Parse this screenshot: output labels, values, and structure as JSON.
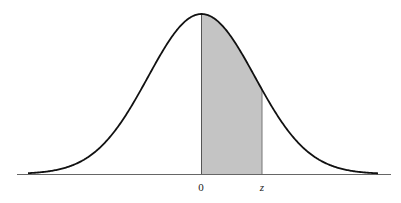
{
  "figure": {
    "type": "normal-distribution-curve",
    "shaded_region": {
      "from_label": "0",
      "to_label": "z"
    },
    "labels": {
      "origin": "0",
      "z": "z"
    },
    "colors": {
      "curve": "#111111",
      "shade": "#c4c4c4",
      "axis": "#555555",
      "background": "#ffffff"
    }
  },
  "chart_data": {
    "type": "area",
    "title": "",
    "xlabel": "",
    "ylabel": "",
    "tick_labels": [
      "0",
      "z"
    ],
    "shaded_interval": [
      "0",
      "z"
    ],
    "grid": false
  }
}
